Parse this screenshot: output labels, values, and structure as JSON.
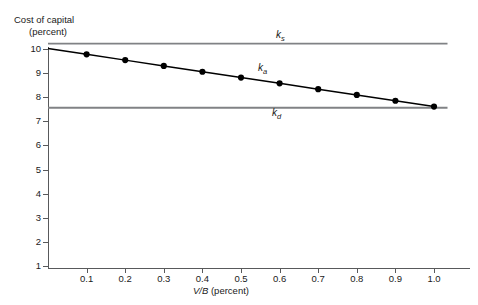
{
  "chart_data": {
    "type": "line",
    "title": "",
    "ylabel": "Cost of capital (percent)",
    "ylabel_line1": "Cost of capital",
    "ylabel_line2": "(percent)",
    "xlabel": "V/B (percent)",
    "xlabel_italic_part": "V/B",
    "xlabel_plain_part": " (percent)",
    "xlim": [
      0,
      1.05
    ],
    "ylim": [
      0,
      10.5
    ],
    "grid": false,
    "legend_position": "inline-annotations",
    "x_tick_labels": [
      "0.1",
      "0.2",
      "0.3",
      "0.4",
      "0.5",
      "0.6",
      "0.7",
      "0.8",
      "0.9",
      "1.0"
    ],
    "x_tick_values": [
      0.1,
      0.2,
      0.3,
      0.4,
      0.5,
      0.6,
      0.7,
      0.8,
      0.9,
      1.0
    ],
    "y_tick_labels": [
      "1",
      "2",
      "3",
      "4",
      "5",
      "6",
      "7",
      "8",
      "9",
      "10"
    ],
    "y_tick_values": [
      1,
      2,
      3,
      4,
      5,
      6,
      7,
      8,
      9,
      10
    ],
    "x": [
      0.0,
      0.1,
      0.2,
      0.3,
      0.4,
      0.5,
      0.6,
      0.7,
      0.8,
      0.9,
      1.0
    ],
    "series": [
      {
        "name": "k_s",
        "label": "k",
        "subscript": "s",
        "style": "flat-line",
        "color": "#808285",
        "markers": false,
        "constant_value": 10.2,
        "values": [
          10.2,
          10.2,
          10.2,
          10.2,
          10.2,
          10.2,
          10.2,
          10.2,
          10.2,
          10.2,
          10.2
        ]
      },
      {
        "name": "k_a",
        "label": "k",
        "subscript": "a",
        "style": "sloped-line-with-markers",
        "color": "#000000",
        "markers": true,
        "values": [
          10.0,
          9.76,
          9.52,
          9.28,
          9.04,
          8.8,
          8.56,
          8.32,
          8.08,
          7.84,
          7.6
        ]
      },
      {
        "name": "k_d",
        "label": "k",
        "subscript": "d",
        "style": "flat-line",
        "color": "#808285",
        "markers": false,
        "constant_value": 7.55,
        "values": [
          7.55,
          7.55,
          7.55,
          7.55,
          7.55,
          7.55,
          7.55,
          7.55,
          7.55,
          7.55,
          7.55
        ]
      }
    ],
    "annotations": [
      {
        "text": "k_s",
        "base": "k",
        "sub": "s"
      },
      {
        "text": "k_a",
        "base": "k",
        "sub": "a"
      },
      {
        "text": "k_d",
        "base": "k",
        "sub": "d"
      }
    ]
  },
  "colors": {
    "axis": "#58595b",
    "flat_line": "#808285",
    "sloped_line": "#000000",
    "marker": "#000000",
    "text": "#1a1a1a",
    "background": "#ffffff"
  }
}
